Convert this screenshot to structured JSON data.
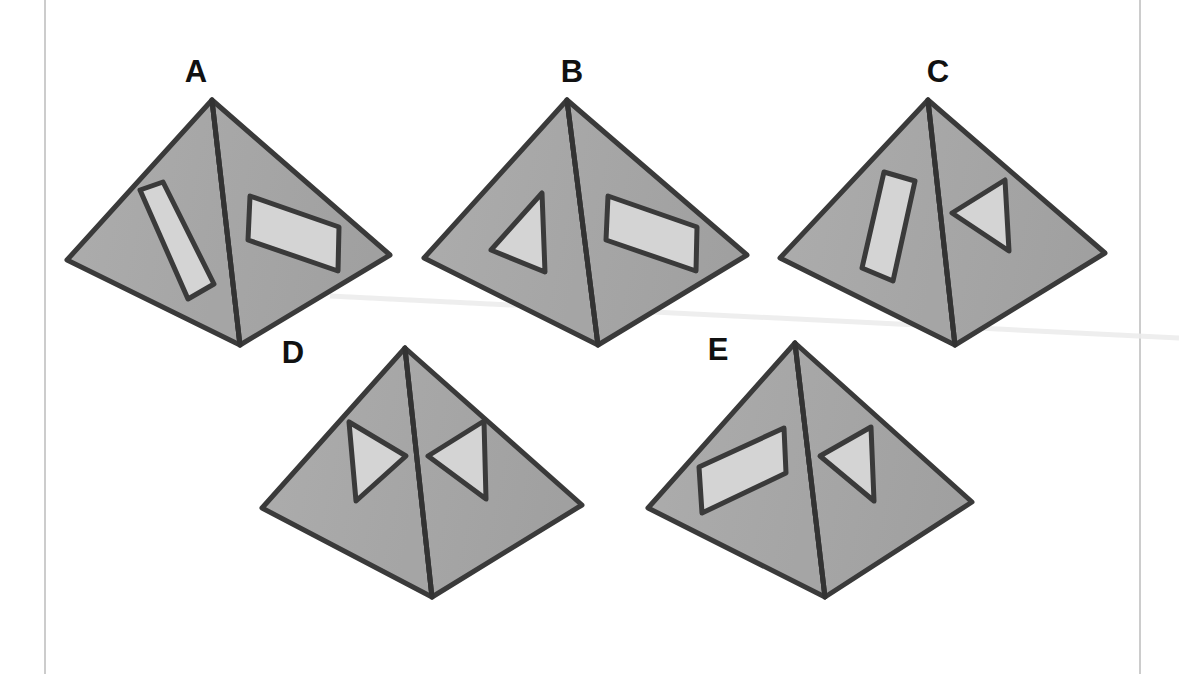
{
  "page": {
    "width": 1179,
    "height": 674,
    "background_color": "#ffffff"
  },
  "palette": {
    "face_fill": "#a9a9a9",
    "face_fill_shaded": "#a3a3a3",
    "outline": "#3a3a3a",
    "ridge": "#333333",
    "cutout_fill": "#d4d4d4",
    "cutout_outline": "#3a3a3a",
    "label_color": "#111111",
    "frame_line": "#cccccc",
    "crease_line": "#ededed"
  },
  "frame": {
    "left_rule_x": 45,
    "right_rule_x": 1140,
    "rule_color": "#cccccc"
  },
  "artifacts": {
    "crease": {
      "description": "faint scanned page crease",
      "from": [
        330,
        296
      ],
      "to": [
        1179,
        338
      ],
      "color": "#ededed"
    }
  },
  "figures": [
    {
      "id": "A",
      "label": "A",
      "label_position": [
        196,
        82
      ],
      "apex": [
        212,
        100
      ],
      "left_vertex": [
        67,
        260
      ],
      "bottom_vertex": [
        240,
        345
      ],
      "right_vertex": [
        390,
        255
      ],
      "left_face": {
        "shape": "rectangle",
        "orientation": "tilted-diagonal",
        "points": [
          [
            140,
            190
          ],
          [
            163,
            182
          ],
          [
            214,
            284
          ],
          [
            188,
            299
          ]
        ]
      },
      "right_face": {
        "shape": "parallelogram",
        "orientation": "slanting-down-right",
        "points": [
          [
            250,
            196
          ],
          [
            339,
            227
          ],
          [
            338,
            271
          ],
          [
            248,
            240
          ]
        ]
      }
    },
    {
      "id": "B",
      "label": "B",
      "label_position": [
        572,
        82
      ],
      "apex": [
        567,
        100
      ],
      "left_vertex": [
        424,
        258
      ],
      "bottom_vertex": [
        598,
        345
      ],
      "right_vertex": [
        747,
        255
      ],
      "left_face": {
        "shape": "triangle",
        "orientation": "pointing-left",
        "points": [
          [
            542,
            193
          ],
          [
            545,
            272
          ],
          [
            491,
            250
          ]
        ]
      },
      "right_face": {
        "shape": "parallelogram",
        "orientation": "slanting-down-right",
        "points": [
          [
            608,
            196
          ],
          [
            697,
            227
          ],
          [
            696,
            271
          ],
          [
            606,
            240
          ]
        ]
      }
    },
    {
      "id": "C",
      "label": "C",
      "label_position": [
        938,
        82
      ],
      "apex": [
        928,
        100
      ],
      "left_vertex": [
        780,
        258
      ],
      "bottom_vertex": [
        955,
        345
      ],
      "right_vertex": [
        1105,
        253
      ],
      "left_face": {
        "shape": "rectangle",
        "orientation": "near-vertical",
        "points": [
          [
            884,
            172
          ],
          [
            915,
            181
          ],
          [
            893,
            281
          ],
          [
            862,
            268
          ]
        ]
      },
      "right_face": {
        "shape": "triangle",
        "orientation": "pointing-left",
        "points": [
          [
            1005,
            180
          ],
          [
            1009,
            251
          ],
          [
            952,
            213
          ]
        ]
      }
    },
    {
      "id": "D",
      "label": "D",
      "label_position": [
        293,
        363
      ],
      "apex": [
        405,
        348
      ],
      "left_vertex": [
        262,
        508
      ],
      "bottom_vertex": [
        432,
        597
      ],
      "right_vertex": [
        582,
        505
      ],
      "left_face": {
        "shape": "triangle",
        "orientation": "pointing-right",
        "points": [
          [
            349,
            422
          ],
          [
            356,
            501
          ],
          [
            406,
            456
          ]
        ]
      },
      "right_face": {
        "shape": "triangle",
        "orientation": "pointing-left",
        "points": [
          [
            484,
            421
          ],
          [
            486,
            499
          ],
          [
            428,
            456
          ]
        ]
      }
    },
    {
      "id": "E",
      "label": "E",
      "label_position": [
        718,
        360
      ],
      "apex": [
        795,
        343
      ],
      "left_vertex": [
        648,
        508
      ],
      "bottom_vertex": [
        825,
        597
      ],
      "right_vertex": [
        972,
        502
      ],
      "left_face": {
        "shape": "parallelogram",
        "orientation": "slanting-down-left",
        "points": [
          [
            784,
            428
          ],
          [
            699,
            467
          ],
          [
            702,
            513
          ],
          [
            786,
            473
          ]
        ]
      },
      "right_face": {
        "shape": "triangle",
        "orientation": "pointing-left",
        "points": [
          [
            871,
            427
          ],
          [
            874,
            501
          ],
          [
            820,
            456
          ]
        ]
      }
    }
  ]
}
